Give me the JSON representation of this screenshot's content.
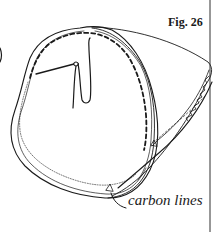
{
  "figure": {
    "label": "Fig. 26",
    "callout_text": "carbon lines",
    "colors": {
      "ink": "#1a1a1a",
      "background": "#ffffff"
    }
  },
  "icons": {
    "needle": "needle-icon",
    "thread": "thread-icon"
  }
}
